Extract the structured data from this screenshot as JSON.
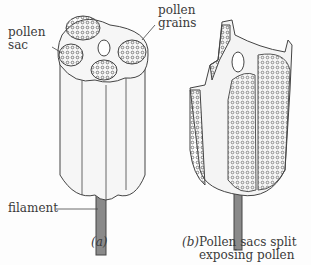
{
  "figure": {
    "part_a": {
      "labels": {
        "pollen_sac": [
          "pollen",
          "sac"
        ],
        "pollen_grains": [
          "pollen",
          "grains"
        ],
        "filament": "filament"
      },
      "caption": "(a)"
    },
    "part_b": {
      "caption_letter": "(b)",
      "caption_lines": [
        "Pollen sacs split",
        "exposing pollen"
      ]
    },
    "colors": {
      "line": "#444444",
      "fill": "#f4f4f4",
      "stipple": "#6a6a6a",
      "filament": "#8a8a8a"
    }
  }
}
